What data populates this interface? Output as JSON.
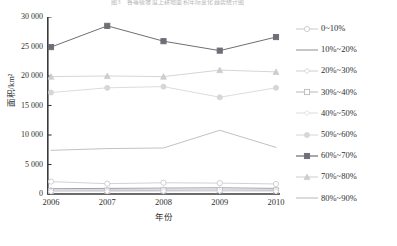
{
  "chart_data": {
    "type": "line",
    "title": "图3　各等级坡度上耕地面积年际变化趋势统计图",
    "xlabel": "年份",
    "ylabel": "面积/km²",
    "x": [
      "2006",
      "2007",
      "2008",
      "2009",
      "2010"
    ],
    "ylim": [
      0,
      30000
    ],
    "yticks": [
      0,
      5000,
      10000,
      15000,
      20000,
      25000,
      30000
    ],
    "ytick_labels": [
      "0",
      "5 000",
      "10 000",
      "15 000",
      "20 000",
      "25 000",
      "30 000"
    ],
    "grid": false,
    "legend_position": "right",
    "series": [
      {
        "name": "0~10%",
        "marker": "open-circle",
        "color": "#c9c9cf",
        "values": [
          2100,
          1750,
          1900,
          1850,
          1700
        ]
      },
      {
        "name": "10%~20%",
        "marker": "none",
        "color": "#8f8f96",
        "values": [
          900,
          950,
          1000,
          1050,
          950
        ]
      },
      {
        "name": "20%~30%",
        "marker": "open-diamond",
        "color": "#cfcfd4",
        "values": [
          700,
          760,
          800,
          830,
          780
        ]
      },
      {
        "name": "30%~40%",
        "marker": "open-square",
        "color": "#b8b8be",
        "values": [
          520,
          560,
          600,
          640,
          600
        ]
      },
      {
        "name": "40%~50%",
        "marker": "open-diamond",
        "color": "#dcdce0",
        "values": [
          400,
          430,
          460,
          480,
          450
        ]
      },
      {
        "name": "50%~60%",
        "marker": "filled-circle",
        "color": "#d6d6da",
        "values": [
          17200,
          18000,
          18200,
          16400,
          18000
        ]
      },
      {
        "name": "60%~70%",
        "marker": "filled-square",
        "color": "#6e6e76",
        "values": [
          24900,
          28500,
          25900,
          24300,
          26600
        ]
      },
      {
        "name": "70%~80%",
        "marker": "filled-triangle",
        "color": "#cccdd1",
        "values": [
          19900,
          20000,
          19900,
          21000,
          20700
        ]
      },
      {
        "name": "80%~90%",
        "marker": "none",
        "color": "#b6b6bb",
        "values": [
          7400,
          7700,
          7800,
          10800,
          7900
        ]
      }
    ]
  }
}
